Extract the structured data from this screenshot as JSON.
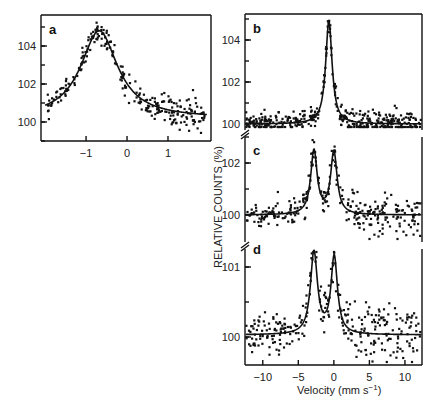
{
  "chart_data": [
    {
      "panel": "a",
      "type": "scatter",
      "title": "",
      "xlabel": "",
      "ylabel": "",
      "xlim": [
        -2.1,
        2.05
      ],
      "ylim": [
        99.0,
        105.5
      ],
      "xticks": [
        -1,
        0,
        1
      ],
      "yticks": [
        100,
        102,
        104
      ],
      "grid": false,
      "fit_model": "lorentzian",
      "baseline": 100.2,
      "peaks": [
        {
          "center": -0.68,
          "height": 4.6,
          "hwhm": 0.55
        }
      ],
      "peak_value": 104.8,
      "peak_velocity": -0.68,
      "scatter_noise": 0.45,
      "n_points": 260
    },
    {
      "panel": "b",
      "type": "scatter",
      "title": "",
      "xlabel": "",
      "ylabel": "",
      "xlim": [
        -12.5,
        12.4
      ],
      "ylim": [
        99.7,
        105.3
      ],
      "xticks": [],
      "yticks": [
        100,
        102,
        104
      ],
      "grid": false,
      "fit_model": "lorentzian",
      "baseline": 100.0,
      "peaks": [
        {
          "center": -0.7,
          "height": 4.9,
          "hwhm": 0.55
        }
      ],
      "peak_value": 104.9,
      "peak_velocity": -0.7,
      "scatter_noise": 0.25,
      "n_points": 420
    },
    {
      "panel": "c",
      "type": "scatter",
      "title": "",
      "xlabel": "",
      "ylabel": "",
      "xlim": [
        -12.5,
        12.4
      ],
      "ylim": [
        99.2,
        103.0
      ],
      "xticks": [],
      "yticks": [
        100,
        102
      ],
      "grid": false,
      "fit_model": "lorentzian",
      "baseline": 100.0,
      "peaks": [
        {
          "center": -2.8,
          "height": 2.45,
          "hwhm": 0.55
        },
        {
          "center": 0.0,
          "height": 2.4,
          "hwhm": 0.55
        }
      ],
      "peak_values": [
        102.5,
        102.45
      ],
      "peak_velocities": [
        -2.8,
        0.0
      ],
      "scatter_noise": 0.3,
      "n_points": 300
    },
    {
      "panel": "d",
      "type": "scatter",
      "title": "",
      "xlabel": "Velocity (mm s⁻¹)",
      "ylabel": "",
      "xlim": [
        -12.5,
        12.4
      ],
      "ylim": [
        99.6,
        101.35
      ],
      "xticks": [
        -10,
        -5,
        0,
        5,
        10
      ],
      "yticks": [
        100,
        101
      ],
      "grid": false,
      "fit_model": "lorentzian",
      "baseline": 100.03,
      "peaks": [
        {
          "center": -2.8,
          "height": 1.17,
          "hwhm": 0.6
        },
        {
          "center": 0.05,
          "height": 1.1,
          "hwhm": 0.55
        }
      ],
      "peak_values": [
        101.2,
        101.15
      ],
      "peak_velocities": [
        -2.8,
        0.05
      ],
      "scatter_noise": 0.17,
      "n_points": 300
    }
  ],
  "labels": {
    "panel_a": "a",
    "panel_b": "b",
    "panel_c": "c",
    "panel_d": "d",
    "y_axis_title": "RELATIVE COUNTS (%)",
    "x_axis_title": "Velocity (mm s⁻¹)",
    "x_axis_title_main": "Velocity (mm s",
    "x_axis_title_sup": "−1",
    "x_axis_title_close": ")"
  },
  "colors": {
    "ink": "#111111",
    "background": "#ffffff"
  }
}
